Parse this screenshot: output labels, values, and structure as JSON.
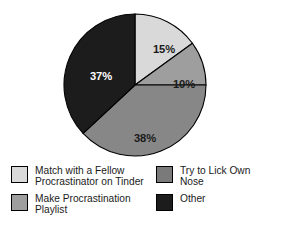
{
  "chart_data": {
    "type": "pie",
    "title": "",
    "subtitle": "",
    "xlabel": "",
    "ylabel": "",
    "grid": false,
    "legend_position": "bottom",
    "legend_columns": 2,
    "categories": [
      "Match with a Fellow Procrastinator on Tinder",
      "Try to Lick Own Nose",
      "Make Procrastination Playlist",
      "Other"
    ],
    "values": [
      15,
      10,
      38,
      37
    ],
    "data_labels": [
      "15%",
      "10%",
      "38%",
      "37%"
    ],
    "colors": [
      "#d9d9d9",
      "#9e9e9e",
      "#878787",
      "#1c1c1c"
    ],
    "slices": [
      {
        "label": "Match with a Fellow Procrastinator on Tinder",
        "value": 15,
        "data_label": "15%",
        "color": "#d9d9d9",
        "label_color": "#1b1b1b",
        "start_angle": 0,
        "end_angle": 54,
        "label_x": 101,
        "label_y": 37
      },
      {
        "label": "Try to Lick Own Nose",
        "value": 10,
        "data_label": "10%",
        "color": "#9e9e9e",
        "label_color": "#1b1b1b",
        "start_angle": 54,
        "end_angle": 90,
        "label_x": 121,
        "label_y": 72
      },
      {
        "label": "Make Procrastination Playlist",
        "value": 38,
        "data_label": "38%",
        "color": "#878787",
        "label_color": "#1b1b1b",
        "start_angle": 90,
        "end_angle": 227,
        "label_x": 82,
        "label_y": 126
      },
      {
        "label": "Other",
        "value": 37,
        "data_label": "37%",
        "color": "#1c1c1c",
        "label_color": "#ffffff",
        "start_angle": 227,
        "end_angle": 360,
        "label_x": 38,
        "label_y": 64
      }
    ]
  },
  "legend": {
    "left_column": [
      {
        "label": "Match with a Fellow\nProcrastinator on Tinder",
        "color": "#d9d9d9"
      },
      {
        "label": "Make Procrastination\nPlaylist",
        "color": "#9e9e9e"
      }
    ],
    "right_column": [
      {
        "label": "Try to Lick Own\nNose",
        "color": "#7a7a7a"
      },
      {
        "label": "Other",
        "color": "#1c1c1c"
      }
    ]
  }
}
